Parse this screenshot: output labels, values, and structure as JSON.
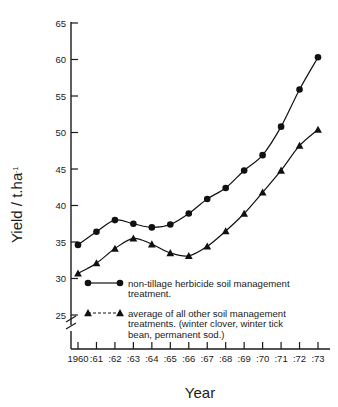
{
  "chart_data": {
    "type": "line",
    "title": "",
    "xlabel": "Year",
    "ylabel": "Yield / t.ha-1",
    "ylabel_base": "Yield / t.ha",
    "ylabel_sup": "-1",
    "categories": [
      "1960",
      ":61",
      ":62",
      ":63",
      ":64",
      ":65",
      ":66",
      ":67",
      ":68",
      ":69",
      ":70",
      ":71",
      ":72",
      ":73"
    ],
    "x": [
      1960,
      1961,
      1962,
      1963,
      1964,
      1965,
      1966,
      1967,
      1968,
      1969,
      1970,
      1971,
      1972,
      1973
    ],
    "ylim": [
      25,
      65
    ],
    "yticks": [
      25,
      30,
      35,
      40,
      45,
      50,
      55,
      60,
      65
    ],
    "ytick_labels": [
      "25",
      "30",
      "35",
      "40",
      "45",
      "50",
      "55",
      "60",
      "65"
    ],
    "axis_break": true,
    "grid": false,
    "legend_position": "inside-lower-left",
    "series": [
      {
        "name": "non-tillage herbicide soil management treatment.",
        "marker": "circle",
        "linestyle": "solid",
        "color": "#111111",
        "values": [
          34.6,
          36.4,
          38.0,
          37.5,
          37.0,
          37.4,
          38.9,
          40.9,
          42.4,
          44.8,
          46.9,
          50.8,
          55.9,
          60.3
        ]
      },
      {
        "name": "average of all other soil management treatments. (winter clover, winter tick bean, permanent sod.)",
        "marker": "triangle",
        "linestyle": "solid",
        "color": "#111111",
        "values": [
          30.7,
          32.1,
          34.1,
          35.5,
          34.7,
          33.5,
          33.1,
          34.4,
          36.5,
          38.9,
          41.8,
          44.8,
          48.2,
          50.4
        ]
      }
    ]
  },
  "legend": {
    "entries": [
      {
        "marker": "circle",
        "lines": [
          "non-tillage herbicide soil management",
          "treatment."
        ]
      },
      {
        "marker": "triangle",
        "lines": [
          "average of all other soil management",
          "treatments. (winter clover, winter tick",
          "bean, permanent sod.)"
        ]
      }
    ]
  },
  "axes": {
    "x_title": "Year",
    "y_title_base": "Yield / t.ha",
    "y_title_sup": "-1"
  }
}
